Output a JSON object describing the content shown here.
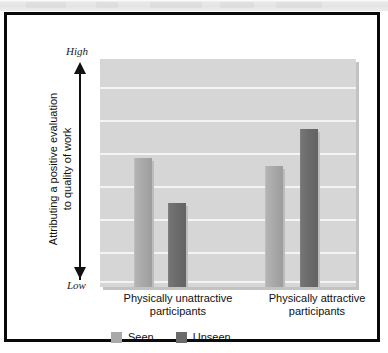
{
  "chart_data": {
    "type": "bar",
    "title": "",
    "subtitle": "",
    "xlabel": "",
    "ylabel_lines": [
      "Attributing a positive evaluation",
      "to quality of work"
    ],
    "ylabel": "Attributing a positive evaluation to quality of work",
    "axis_high_label": "High",
    "axis_low_label": "Low",
    "ylim": [
      0,
      1
    ],
    "y_tick_labels": [],
    "grid": true,
    "gridline_count": 7,
    "legend_position": "bottom",
    "categories": [
      "Physically unattractive participants",
      "Physically attractive participants"
    ],
    "category_lines": [
      [
        "Physically unattractive",
        "participants"
      ],
      [
        "Physically attractive",
        "participants"
      ]
    ],
    "series": [
      {
        "name": "Seen",
        "color": "#a9a9a9",
        "values": [
          0.565,
          0.53
        ]
      },
      {
        "name": "Unseen",
        "color": "#6b6b6b",
        "values": [
          0.368,
          0.693
        ]
      }
    ],
    "annotations": []
  },
  "legend": {
    "items": [
      {
        "label": "Seen",
        "color": "#a9a9a9"
      },
      {
        "label": "Unseen",
        "color": "#6b6b6b"
      }
    ]
  },
  "style": {
    "plot_background": "#d6d6d6",
    "gridline_color": "#f4f4f4",
    "frame_color": "#0a0a0a",
    "page_background": "#ffffff",
    "text_color": "#111111"
  }
}
